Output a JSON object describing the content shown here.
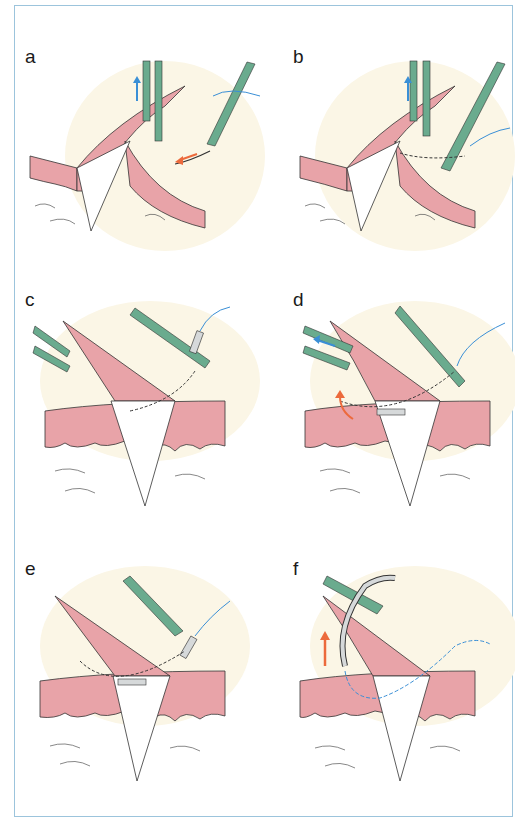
{
  "figure": {
    "panels": [
      {
        "id": "a",
        "label": "a"
      },
      {
        "id": "b",
        "label": "b"
      },
      {
        "id": "c",
        "label": "c"
      },
      {
        "id": "d",
        "label": "d"
      },
      {
        "id": "e",
        "label": "e"
      },
      {
        "id": "f",
        "label": "f"
      }
    ],
    "colors": {
      "frame_border": "#9cc4dc",
      "background_glow": "#fbf6e6",
      "skin_pink": "#e8a3a8",
      "instrument_green": "#6aab8e",
      "suture_blue": "#3a8fd6",
      "arrow_blue": "#3a8fd6",
      "arrow_orange": "#ec6a3c",
      "needle_gray": "#d6d9da",
      "outline": "#333333"
    }
  }
}
